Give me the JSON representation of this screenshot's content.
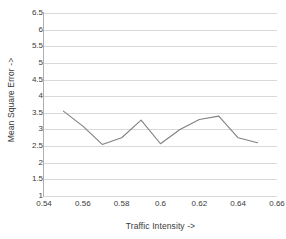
{
  "chart_data": {
    "type": "line",
    "title": "",
    "xlabel": "Traffic Intensity ->",
    "ylabel": "Mean Square Error  ->",
    "xlim": [
      0.54,
      0.66
    ],
    "ylim": [
      1,
      6.5
    ],
    "grid": true,
    "legend": "none",
    "line_color": "#808080",
    "gridline_color": "#d9d9d9",
    "axis_color": "#b0b0b0",
    "text_color": "#3a3a3a",
    "x_ticks": [
      "0.54",
      "0.56",
      "0.58",
      "0.6",
      "0.62",
      "0.64",
      "0.66"
    ],
    "x_tick_values": [
      0.54,
      0.56,
      0.58,
      0.6,
      0.62,
      0.64,
      0.66
    ],
    "y_ticks": [
      "1",
      "1.5",
      "2",
      "2.5",
      "3",
      "3.5",
      "4",
      "4.5",
      "5",
      "5.5",
      "6",
      "6.5"
    ],
    "y_tick_values": [
      1,
      1.5,
      2,
      2.5,
      3,
      3.5,
      4,
      4.5,
      5,
      5.5,
      6,
      6.5
    ],
    "series": [
      {
        "name": "Mean Square Error",
        "x": [
          0.55,
          0.56,
          0.57,
          0.58,
          0.59,
          0.6,
          0.61,
          0.62,
          0.63,
          0.64,
          0.65
        ],
        "values": [
          3.55,
          3.1,
          2.55,
          2.75,
          3.28,
          2.57,
          3.0,
          3.3,
          3.4,
          2.75,
          2.6
        ]
      }
    ]
  }
}
